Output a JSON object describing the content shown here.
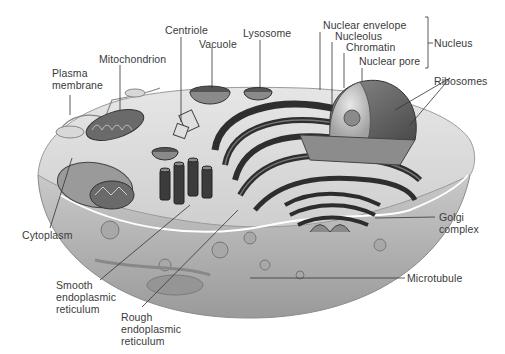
{
  "figure": {
    "labels": {
      "centriole": "Centriole",
      "vacuole": "Vacuole",
      "lysosome": "Lysosome",
      "mitochondrion": "Mitochondrion",
      "plasma_membrane": "Plasma\nmembrane",
      "nuclear_envelope": "Nuclear envelope",
      "nucleolus": "Nucleolus",
      "chromatin": "Chromatin",
      "nuclear_pore": "Nuclear pore",
      "nucleus": "Nucleus",
      "ribosomes": "Ribosomes",
      "cytoplasm": "Cytoplasm",
      "golgi_complex": "Golgi\ncomplex",
      "smooth_er": "Smooth\nendoplasmic\nreticulum",
      "rough_er": "Rough\nendoplasmic\nreticulum",
      "microtubule": "Microtubule"
    },
    "colors": {
      "cytoplasm_fill": "#bdbdbd",
      "cell_edge": "#8a8a8a",
      "organelle_dark": "#3c3c3c",
      "organelle_mid": "#7a7a7a",
      "label_text": "#3a3a3a",
      "leader_line": "#333333"
    }
  }
}
